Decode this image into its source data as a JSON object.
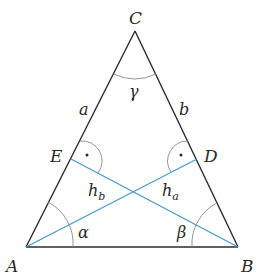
{
  "diagram": {
    "colors": {
      "triangle": "#2b2b2b",
      "altitude": "#4a9ccc",
      "arc": "#8a8a8a",
      "text": "#2a2a2a",
      "background": "#ffffff"
    },
    "vertices": {
      "A": {
        "label": "A",
        "x": 26,
        "y": 247
      },
      "B": {
        "label": "B",
        "x": 238,
        "y": 247
      },
      "C": {
        "label": "C",
        "x": 135,
        "y": 31
      }
    },
    "feet": {
      "E": {
        "label": "E",
        "x": 71,
        "y": 159
      },
      "D": {
        "label": "D",
        "x": 197,
        "y": 159
      }
    },
    "sides": {
      "a": {
        "label": "a"
      },
      "b": {
        "label": "b"
      }
    },
    "angles": {
      "alpha": {
        "label": "α"
      },
      "beta": {
        "label": "β"
      },
      "gamma": {
        "label": "γ"
      }
    },
    "altitudes": {
      "h_a": {
        "main": "h",
        "sub": "a",
        "from": "A",
        "to": "D"
      },
      "h_b": {
        "main": "h",
        "sub": "b",
        "from": "B",
        "to": "E"
      }
    },
    "right_angle_marker": "·"
  }
}
